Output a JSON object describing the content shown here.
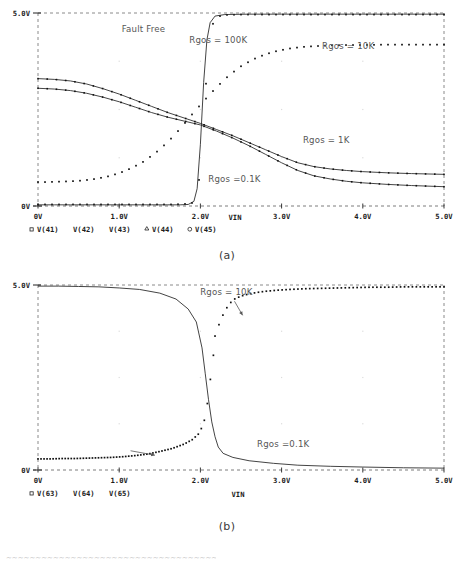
{
  "figure": {
    "captions": [
      {
        "id": "a",
        "label": "(a)"
      },
      {
        "id": "b",
        "label": "(b)"
      }
    ],
    "footer_smudge": "~~~~~~~~~~~~~~~~~~~~~~~~~~~~~~~~~~~~~~~~~~~"
  },
  "chart_data": [
    {
      "id": "panel-a",
      "type": "line",
      "title": "",
      "xlabel": "VIN",
      "ylabel": "",
      "xlim": [
        0,
        5
      ],
      "ylim": [
        0,
        5
      ],
      "grid": true,
      "grid_style": "dashed-border-box",
      "x_ticks": [
        0,
        1,
        2,
        3,
        4,
        5
      ],
      "x_tick_labels": [
        "0V",
        "1.0V",
        "2.0V",
        "3.0V",
        "4.0V",
        "5.0V"
      ],
      "y_ticks": [
        0,
        5
      ],
      "y_tick_labels": [
        "0V",
        "5.0V"
      ],
      "legend": {
        "position": "below-axis",
        "entries": [
          {
            "marker": "square",
            "label": "V(41)"
          },
          {
            "marker": "none",
            "label": "V(42)"
          },
          {
            "marker": "none",
            "label": "V(43)"
          },
          {
            "marker": "triangle",
            "label": "V(44)"
          },
          {
            "marker": "circle",
            "label": "V(45)"
          }
        ]
      },
      "annotations": [
        {
          "text": "Fault Free",
          "x": 1.3,
          "y": 4.52
        },
        {
          "text": "Rgos = 100K",
          "x": 2.22,
          "y": 4.22
        },
        {
          "text": "Rgos = 10K",
          "x": 3.82,
          "y": 4.08
        },
        {
          "text": "Rgos = 1K",
          "x": 3.55,
          "y": 1.62
        },
        {
          "text": "Rgos =0.1K",
          "x": 2.42,
          "y": 0.62
        }
      ],
      "series": [
        {
          "name": "V(41) Rgos = 0.1K (flat low, dotted)",
          "style": "dotted",
          "x": [
            0.0,
            0.15,
            0.3,
            0.45,
            0.6,
            0.75,
            0.9,
            1.05,
            1.2,
            1.35,
            1.5,
            1.65,
            1.8,
            1.9,
            1.95,
            2.0,
            2.05,
            2.1,
            2.15,
            2.2,
            2.3,
            2.5,
            2.8,
            3.2,
            3.6,
            4.0,
            4.4,
            4.8,
            5.0
          ],
          "y": [
            0.04,
            0.04,
            0.04,
            0.04,
            0.04,
            0.04,
            0.04,
            0.04,
            0.04,
            0.04,
            0.04,
            0.04,
            0.05,
            0.08,
            0.25,
            0.9,
            2.6,
            4.1,
            4.7,
            4.9,
            4.95,
            4.96,
            4.96,
            4.96,
            4.96,
            4.96,
            4.96,
            4.96,
            4.96
          ]
        },
        {
          "name": "V(42) Fault Free (sharp switching, solid)",
          "style": "solid",
          "x": [
            0.0,
            0.2,
            0.4,
            0.6,
            0.8,
            1.0,
            1.2,
            1.4,
            1.6,
            1.75,
            1.85,
            1.92,
            1.96,
            2.0,
            2.04,
            2.08,
            2.12,
            2.18,
            2.3,
            2.6,
            3.0,
            3.5,
            4.0,
            4.5,
            5.0
          ],
          "y": [
            0.03,
            0.03,
            0.03,
            0.03,
            0.03,
            0.03,
            0.03,
            0.03,
            0.03,
            0.03,
            0.04,
            0.12,
            0.45,
            1.6,
            3.2,
            4.3,
            4.75,
            4.92,
            4.96,
            4.97,
            4.97,
            4.97,
            4.97,
            4.97,
            4.97
          ]
        },
        {
          "name": "V(43) Rgos = 10K (slow rise, dotted)",
          "style": "dotted",
          "x": [
            0.0,
            0.1,
            0.25,
            0.4,
            0.55,
            0.7,
            0.85,
            1.0,
            1.15,
            1.3,
            1.45,
            1.6,
            1.75,
            1.9,
            2.05,
            2.2,
            2.35,
            2.5,
            2.65,
            2.8,
            2.95,
            3.1,
            3.25,
            3.4,
            3.6,
            3.8,
            4.0,
            4.25,
            4.5,
            4.75,
            5.0
          ],
          "y": [
            0.62,
            0.62,
            0.63,
            0.64,
            0.66,
            0.7,
            0.76,
            0.85,
            0.98,
            1.15,
            1.38,
            1.66,
            2.0,
            2.38,
            2.74,
            3.08,
            3.38,
            3.62,
            3.8,
            3.93,
            4.02,
            4.08,
            4.12,
            4.14,
            4.16,
            4.17,
            4.17,
            4.18,
            4.18,
            4.18,
            4.18
          ]
        },
        {
          "name": "V(44) inverter high branch (solid, falling)",
          "style": "solid-marked",
          "x": [
            0.0,
            0.2,
            0.4,
            0.6,
            0.8,
            1.0,
            1.2,
            1.4,
            1.6,
            1.8,
            2.0,
            2.2,
            2.4,
            2.6,
            2.8,
            3.0,
            3.2,
            3.4,
            3.6,
            3.8,
            4.0,
            4.3,
            4.6,
            5.0
          ],
          "y": [
            3.3,
            3.28,
            3.24,
            3.16,
            3.04,
            2.9,
            2.74,
            2.58,
            2.42,
            2.28,
            2.14,
            1.98,
            1.82,
            1.64,
            1.46,
            1.28,
            1.12,
            1.02,
            0.96,
            0.92,
            0.89,
            0.86,
            0.84,
            0.82
          ]
        },
        {
          "name": "V(45) inverter low branch (solid, falling)",
          "style": "solid-marked",
          "x": [
            0.0,
            0.2,
            0.4,
            0.6,
            0.8,
            1.0,
            1.2,
            1.4,
            1.6,
            1.8,
            2.0,
            2.2,
            2.4,
            2.6,
            2.8,
            3.0,
            3.2,
            3.4,
            3.6,
            3.8,
            4.0,
            4.3,
            4.6,
            5.0
          ],
          "y": [
            3.05,
            3.03,
            2.99,
            2.92,
            2.82,
            2.7,
            2.56,
            2.42,
            2.3,
            2.2,
            2.1,
            1.94,
            1.76,
            1.56,
            1.34,
            1.12,
            0.92,
            0.78,
            0.7,
            0.64,
            0.6,
            0.56,
            0.53,
            0.5
          ]
        }
      ]
    },
    {
      "id": "panel-b",
      "type": "line",
      "title": "",
      "xlabel": "VIN",
      "ylabel": "",
      "xlim": [
        0,
        5
      ],
      "ylim": [
        0,
        5
      ],
      "grid": true,
      "grid_style": "dashed-border-box",
      "x_ticks": [
        0,
        1,
        2,
        3,
        4,
        5
      ],
      "x_tick_labels": [
        "0V",
        "1.0V",
        "2.0V",
        "3.0V",
        "4.0V",
        "5.0V"
      ],
      "y_ticks": [
        0,
        5
      ],
      "y_tick_labels": [
        "0V",
        "5.0V"
      ],
      "legend": {
        "position": "below-axis",
        "entries": [
          {
            "marker": "square",
            "label": "V(63)"
          },
          {
            "marker": "none",
            "label": "V(64)"
          },
          {
            "marker": "none",
            "label": "V(65)"
          }
        ]
      },
      "annotations": [
        {
          "text": "Rgos = 10K",
          "x": 2.32,
          "y": 4.74
        },
        {
          "text": "Rgos =0.1K",
          "x": 3.02,
          "y": 0.62
        }
      ],
      "arrows": [
        {
          "from_x": 2.42,
          "from_y": 4.56,
          "to_x": 2.52,
          "to_y": 4.18
        },
        {
          "from_x": 1.14,
          "from_y": 0.52,
          "to_x": 1.44,
          "to_y": 0.4
        }
      ],
      "series": [
        {
          "name": "V(63) falling inverter (solid)",
          "style": "solid",
          "x": [
            0.0,
            0.25,
            0.5,
            0.75,
            1.0,
            1.25,
            1.5,
            1.7,
            1.85,
            1.95,
            2.02,
            2.06,
            2.1,
            2.14,
            2.18,
            2.22,
            2.28,
            2.4,
            2.6,
            2.9,
            3.2,
            3.6,
            4.0,
            4.5,
            5.0
          ],
          "y": [
            4.97,
            4.97,
            4.96,
            4.95,
            4.92,
            4.88,
            4.78,
            4.62,
            4.35,
            4.0,
            3.3,
            2.6,
            1.9,
            1.3,
            0.9,
            0.62,
            0.45,
            0.34,
            0.25,
            0.18,
            0.13,
            0.1,
            0.08,
            0.06,
            0.05
          ]
        },
        {
          "name": "V(64) Rgos = 10K rising (dotted, upper band)",
          "style": "dotted",
          "x": [
            2.18,
            2.24,
            2.3,
            2.36,
            2.42,
            2.5,
            2.6,
            2.7,
            2.8,
            2.95,
            3.1,
            3.3,
            3.5,
            3.7,
            3.9,
            4.1,
            4.3,
            4.5,
            4.7,
            4.9,
            5.0
          ],
          "y": [
            3.62,
            4.0,
            4.3,
            4.5,
            4.62,
            4.7,
            4.76,
            4.8,
            4.83,
            4.86,
            4.88,
            4.9,
            4.91,
            4.92,
            4.93,
            4.94,
            4.94,
            4.95,
            4.95,
            4.95,
            4.95
          ]
        },
        {
          "name": "V(65) Rgos =0.1K low band (dotted, rising slightly)",
          "style": "dotted",
          "x": [
            0.0,
            0.15,
            0.3,
            0.45,
            0.6,
            0.75,
            0.9,
            1.05,
            1.2,
            1.35,
            1.5,
            1.65,
            1.8,
            1.9,
            1.98,
            2.04,
            2.08,
            2.12,
            2.16
          ],
          "y": [
            0.3,
            0.3,
            0.31,
            0.31,
            0.32,
            0.33,
            0.34,
            0.36,
            0.39,
            0.43,
            0.5,
            0.58,
            0.7,
            0.82,
            0.98,
            1.25,
            1.7,
            2.4,
            3.1
          ]
        }
      ]
    }
  ]
}
